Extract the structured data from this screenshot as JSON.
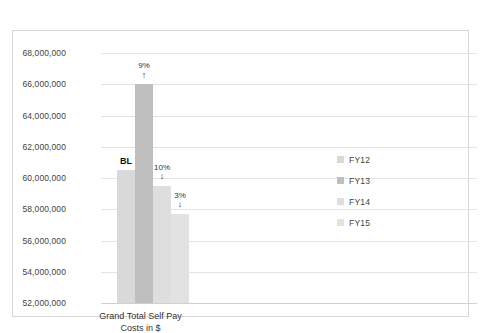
{
  "chart_data": {
    "type": "bar",
    "title": "",
    "subtitle": "",
    "xlabel": "Grand Total Self Pay Costs in $",
    "xlabel_lines": [
      "Grand Total Self Pay",
      "Costs in $"
    ],
    "ylabel": "",
    "ylim": [
      52000000,
      68000000
    ],
    "ytick_step": 2000000,
    "ytick_labels": [
      "68,000,000",
      "66,000,000",
      "64,000,000",
      "62,000,000",
      "60,000,000",
      "58,000,000",
      "56,000,000",
      "54,000,000",
      "52,000,000"
    ],
    "ytick_values": [
      68000000,
      66000000,
      64000000,
      62000000,
      60000000,
      58000000,
      56000000,
      54000000,
      52000000
    ],
    "grid": true,
    "grid_axis": "y",
    "legend_position": "right",
    "categories": [
      "Grand Total Self Pay Costs in $"
    ],
    "series": [
      {
        "name": "FY12",
        "values": [
          60500000
        ],
        "color": "#d9d9d9",
        "annotation": "BL",
        "annotation_arrow": ""
      },
      {
        "name": "FY13",
        "values": [
          66000000
        ],
        "color": "#bfbfbf",
        "annotation": "9%",
        "annotation_arrow": "↑"
      },
      {
        "name": "FY14",
        "values": [
          59500000
        ],
        "color": "#dedede",
        "annotation": "10%",
        "annotation_arrow": "↓"
      },
      {
        "name": "FY15",
        "values": [
          57700000
        ],
        "color": "#e2e2e2",
        "annotation": "3%",
        "annotation_arrow": "↓"
      }
    ],
    "legend_entries": [
      {
        "label": "FY12",
        "color": "#d9d9d9"
      },
      {
        "label": "FY13",
        "color": "#bfbfbf"
      },
      {
        "label": "FY14",
        "color": "#dedede"
      },
      {
        "label": "FY15",
        "color": "#e2e2e2"
      }
    ]
  },
  "style": {
    "frame_border": "#d7d7d7",
    "gridline": "#e4e4e4",
    "text": "#3f3f3f",
    "background": "#ffffff"
  }
}
